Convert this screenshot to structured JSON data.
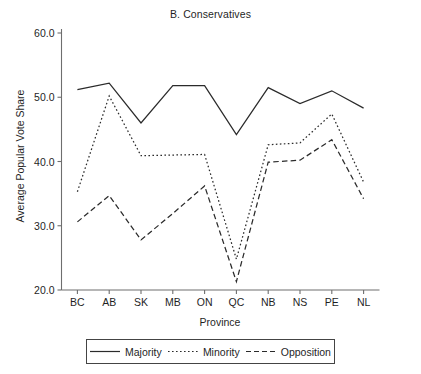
{
  "chart_data": {
    "type": "line",
    "title": "B. Conservatives",
    "xlabel": "Province",
    "ylabel": "Average Popular Vote Share",
    "categories": [
      "BC",
      "AB",
      "SK",
      "MB",
      "ON",
      "QC",
      "NB",
      "NS",
      "PE",
      "NL"
    ],
    "ylim": [
      20.0,
      60.0
    ],
    "yticks": [
      "20.0",
      "30.0",
      "40.0",
      "50.0",
      "60.0"
    ],
    "ytick_values": [
      20.0,
      30.0,
      40.0,
      50.0,
      60.0
    ],
    "grid": false,
    "legend_position": "below-axes",
    "series": [
      {
        "name": "Majority",
        "style": "solid",
        "color": "#2b2b2b",
        "values": [
          51.2,
          52.2,
          46.0,
          51.8,
          51.8,
          44.2,
          51.5,
          49.0,
          51.0,
          48.3
        ]
      },
      {
        "name": "Minority",
        "style": "dotted",
        "color": "#2b2b2b",
        "values": [
          35.3,
          50.2,
          40.9,
          41.0,
          41.1,
          24.8,
          42.6,
          42.9,
          47.4,
          36.8
        ]
      },
      {
        "name": "Opposition",
        "style": "dashed",
        "color": "#2b2b2b",
        "values": [
          30.6,
          34.7,
          27.8,
          31.9,
          36.2,
          21.3,
          39.9,
          40.2,
          43.4,
          34.2
        ]
      }
    ]
  },
  "legend": {
    "items": [
      {
        "label": "Majority"
      },
      {
        "label": "Minority"
      },
      {
        "label": "Opposition"
      }
    ]
  }
}
